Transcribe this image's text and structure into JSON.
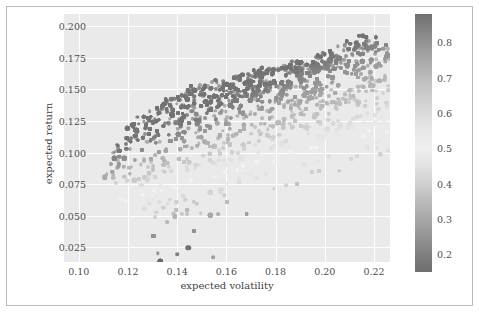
{
  "chart_data": {
    "type": "scatter",
    "title": "",
    "xlabel": "expected volatility",
    "ylabel": "expected return",
    "xlim": [
      0.094,
      0.2265
    ],
    "ylim": [
      0.0135,
      0.2095
    ],
    "xticks": [
      0.1,
      0.12,
      0.14,
      0.16,
      0.18,
      0.2,
      0.22
    ],
    "xtick_labels": [
      "0.10",
      "0.12",
      "0.14",
      "0.16",
      "0.18",
      "0.20",
      "0.22"
    ],
    "yticks": [
      0.025,
      0.05,
      0.075,
      0.1,
      0.125,
      0.15,
      0.175,
      0.2
    ],
    "ytick_labels": [
      "0.025",
      "0.050",
      "0.075",
      "0.100",
      "0.125",
      "0.150",
      "0.175",
      "0.200"
    ],
    "grid": true,
    "legend": null,
    "colorbar": {
      "label": "Sharpe ratio",
      "position": "right",
      "vmin": 0.15,
      "vmax": 0.88,
      "ticks": [
        0.2,
        0.3,
        0.4,
        0.5,
        0.6,
        0.7,
        0.8
      ],
      "tick_labels": [
        "0.2",
        "0.3",
        "0.4",
        "0.5",
        "0.6",
        "0.7",
        "0.8"
      ],
      "colormap": "gray-cyclic"
    },
    "point_count": 5200,
    "marker_size": 4,
    "color_by": "sharpe_ratio",
    "notable_points": [
      {
        "x": 0.1445,
        "y": 0.0248,
        "sharpe": 0.17,
        "note": "isolated low-return outlier"
      },
      {
        "x": 0.2155,
        "y": 0.1925,
        "sharpe": 0.89,
        "note": "max return upper-right tip"
      },
      {
        "x": 0.1105,
        "y": 0.0805,
        "sharpe": 0.73,
        "note": "minimum volatility region"
      }
    ],
    "series": [
      {
        "name": "portfolios",
        "x": [
          0.1105,
          0.1112,
          0.1121,
          0.1134,
          0.1148,
          0.1162,
          0.1178,
          0.1195,
          0.1213,
          0.1232,
          0.1252,
          0.1273,
          0.1295,
          0.1318,
          0.1342,
          0.1367,
          0.1393,
          0.142,
          0.1448,
          0.1477,
          0.1507,
          0.1538,
          0.157,
          0.1603,
          0.1637,
          0.1672,
          0.1708,
          0.1745,
          0.1783,
          0.1822,
          0.1862,
          0.1903,
          0.1945,
          0.1988,
          0.2032,
          0.2077,
          0.2123,
          0.2155
        ],
        "y": [
          0.0805,
          0.0862,
          0.0915,
          0.0968,
          0.1018,
          0.1065,
          0.111,
          0.1152,
          0.1192,
          0.1229,
          0.1264,
          0.1297,
          0.1328,
          0.1357,
          0.1385,
          0.1411,
          0.1436,
          0.1459,
          0.1481,
          0.1502,
          0.1522,
          0.1541,
          0.1559,
          0.1577,
          0.1594,
          0.1611,
          0.1628,
          0.1645,
          0.1662,
          0.1679,
          0.1696,
          0.1713,
          0.1731,
          0.1749,
          0.179,
          0.184,
          0.189,
          0.1925
        ],
        "sharpe": [
          0.73,
          0.775,
          0.816,
          0.854,
          0.886,
          0.873,
          0.855,
          0.835,
          0.812,
          0.79,
          0.768,
          0.746,
          0.725,
          0.705,
          0.686,
          0.668,
          0.651,
          0.635,
          0.62,
          0.606,
          0.592,
          0.579,
          0.567,
          0.556,
          0.545,
          0.535,
          0.525,
          0.516,
          0.508,
          0.5,
          0.492,
          0.485,
          0.478,
          0.472,
          0.48,
          0.492,
          0.505,
          0.515
        ]
      }
    ]
  },
  "figure": {
    "background": "#ffffff",
    "plot_background": "#eaeaea",
    "grid_color": "#ffffff",
    "border_color": "#b9b9b9",
    "tick_label_color": "#4d4d4d",
    "axis_label_color": "#3f3f3f"
  }
}
